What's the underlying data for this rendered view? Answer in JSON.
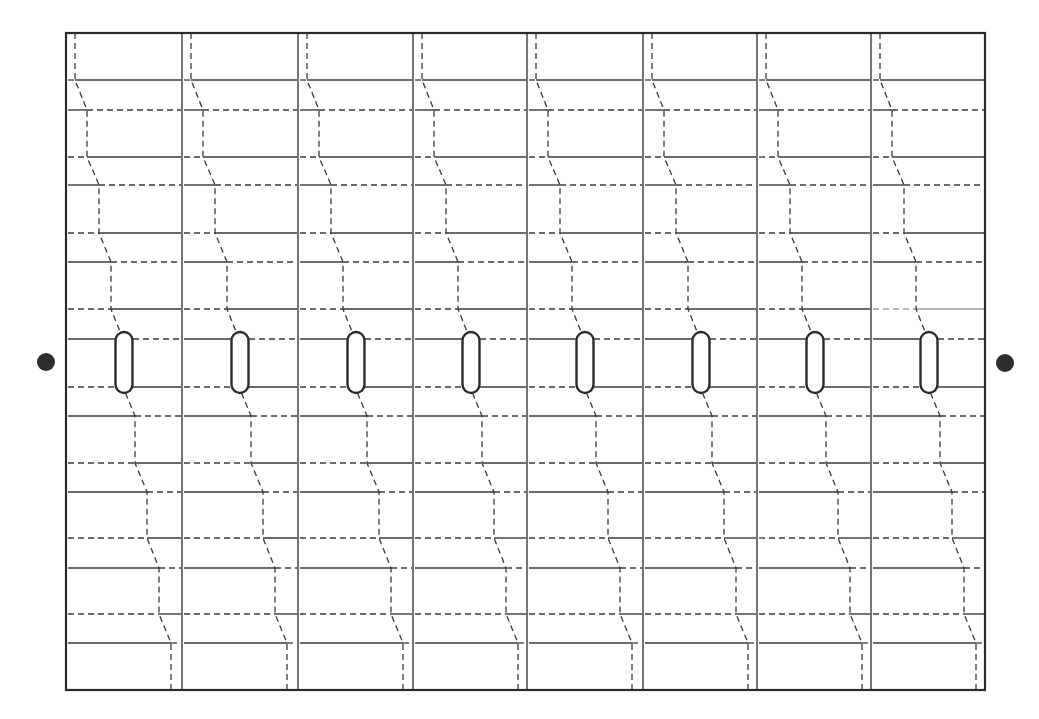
{
  "diagram": {
    "type": "block-wall / staggered panel layout with slots",
    "frame": {
      "left": 66,
      "top": 33,
      "right": 985,
      "bottom": 690
    },
    "columns": {
      "count": 8,
      "dividers_x": [
        66,
        182,
        298,
        413,
        527,
        643,
        757,
        871,
        985
      ]
    },
    "horizontal_lines": [
      {
        "y": 80,
        "left_style": "dashed",
        "right_style": "solid"
      },
      {
        "y": 110,
        "left_style": "solid",
        "right_style": "dashed"
      },
      {
        "y": 157,
        "left_style": "dashed",
        "right_style": "solid"
      },
      {
        "y": 185,
        "left_style": "solid",
        "right_style": "dashed"
      },
      {
        "y": 233,
        "left_style": "dashed",
        "right_style": "solid"
      },
      {
        "y": 262,
        "left_style": "solid",
        "right_style": "dashed"
      },
      {
        "y": 309,
        "left_style": "dashed",
        "right_style": "solid"
      },
      {
        "y": 339,
        "left_style": "solid",
        "right_style": "dashed"
      },
      {
        "y": 387,
        "left_style": "dashed",
        "right_style": "solid"
      },
      {
        "y": 416,
        "left_style": "solid",
        "right_style": "dashed"
      },
      {
        "y": 463,
        "left_style": "dashed",
        "right_style": "solid"
      },
      {
        "y": 492,
        "left_style": "solid",
        "right_style": "dashed"
      },
      {
        "y": 538,
        "left_style": "dashed",
        "right_style": "solid"
      },
      {
        "y": 568,
        "left_style": "solid",
        "right_style": "dashed"
      },
      {
        "y": 614,
        "left_style": "dashed",
        "right_style": "solid"
      },
      {
        "y": 643,
        "left_style": "solid",
        "right_style": "dashed"
      }
    ],
    "zigzag_offsets": [
      {
        "y_from": 33,
        "y_to": 80,
        "offset": 9
      },
      {
        "y_from": 110,
        "y_to": 157,
        "offset": 21
      },
      {
        "y_from": 185,
        "y_to": 233,
        "offset": 33
      },
      {
        "y_from": 262,
        "y_to": 309,
        "offset": 45
      },
      {
        "y_from": 339,
        "y_to": 387,
        "offset": 57
      },
      {
        "y_from": 416,
        "y_to": 463,
        "offset": 69
      },
      {
        "y_from": 492,
        "y_to": 538,
        "offset": 81
      },
      {
        "y_from": 568,
        "y_to": 614,
        "offset": 93
      },
      {
        "y_from": 643,
        "y_to": 690,
        "offset": 105
      }
    ],
    "slots": {
      "count": 8,
      "offset_center": 58,
      "width": 17,
      "top": 332,
      "bottom": 393
    },
    "end_dots": [
      {
        "name": "left-end-dot",
        "cx": 46,
        "cy": 362,
        "r": 9
      },
      {
        "name": "right-end-dot",
        "cx": 1005,
        "cy": 363,
        "r": 9
      }
    ],
    "colors": {
      "line": "#3a3a3a",
      "frame": "#2b2b2b",
      "dot": "#2e2e2e",
      "background": "#ffffff"
    }
  }
}
